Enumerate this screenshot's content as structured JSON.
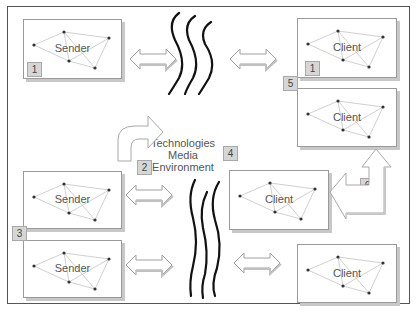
{
  "diagram": {
    "nodes": [
      {
        "id": "sender-top",
        "label": "Sender",
        "badge": "1"
      },
      {
        "id": "sender-mid",
        "label": "Sender"
      },
      {
        "id": "sender-bottom",
        "label": "Sender"
      },
      {
        "id": "client-top",
        "label": "Client",
        "badge": "1"
      },
      {
        "id": "client-second",
        "label": "Client"
      },
      {
        "id": "client-mid",
        "label": "Client"
      },
      {
        "id": "client-bottom",
        "label": "Client"
      }
    ],
    "center": {
      "line1": "Technologies",
      "line2": "Media",
      "line3": "Environment"
    },
    "badges": {
      "b2": "2",
      "b3": "3",
      "b4": "4",
      "b5": "5",
      "b6": "6"
    },
    "colors": {
      "border": "#9a9a9a",
      "shadow": "#c8c8c8",
      "badge_fill": "#d6d6d6",
      "wave": "#111111",
      "arrow_outline": "#9a9a9a"
    }
  }
}
